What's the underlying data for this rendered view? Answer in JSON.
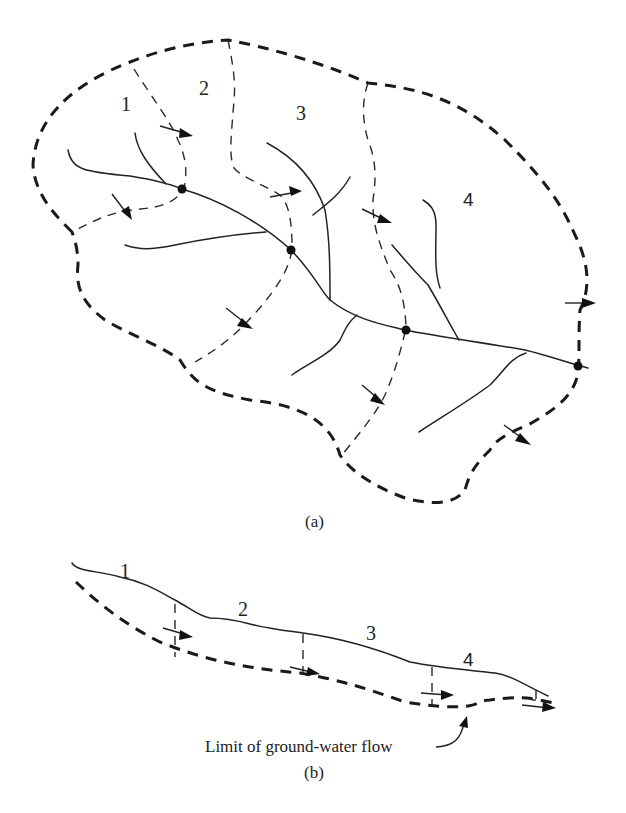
{
  "figure": {
    "panel_a": {
      "caption": "(a)",
      "subbasin_labels": [
        "1",
        "2",
        "3",
        "4"
      ],
      "description": "Plan view of a watershed divided into four sub-basins with stream network, outlet nodes, and flow arrows across divides"
    },
    "panel_b": {
      "caption": "(b)",
      "segment_labels": [
        "1",
        "2",
        "3",
        "4"
      ],
      "annotation": "Limit of ground-water flow",
      "description": "Longitudinal profile along the main stream showing sub-basin segments and the limit of ground-water flow"
    },
    "colors": {
      "ink": "#1a1a1a",
      "background": "#ffffff"
    }
  }
}
